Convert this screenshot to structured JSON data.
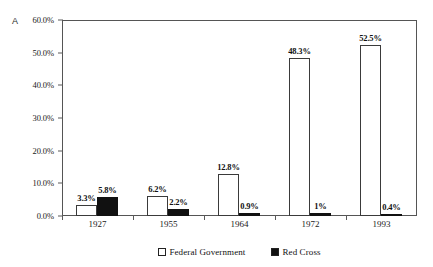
{
  "panel": {
    "label": "A"
  },
  "chart_data": {
    "type": "bar",
    "title": "",
    "xlabel": "",
    "ylabel": "",
    "ylim": [
      0,
      60
    ],
    "ytick_values": [
      0,
      10,
      20,
      30,
      40,
      50,
      60
    ],
    "ytick_labels": [
      "0.0%",
      "10.0%",
      "20.0%",
      "30.0%",
      "40.0%",
      "50.0%",
      "60.0%"
    ],
    "grid": false,
    "legend_position": "bottom-right",
    "categories": [
      "1927",
      "1955",
      "1964",
      "1972",
      "1993"
    ],
    "series": [
      {
        "name": "Federal Government",
        "color": "#ffffff",
        "edge_color": "#3a3a3a",
        "values": [
          3.3,
          6.2,
          12.8,
          48.3,
          52.5
        ],
        "data_labels": [
          "3.3%",
          "6.2%",
          "12.8%",
          "48.3%",
          "52.5%"
        ]
      },
      {
        "name": "Red Cross",
        "color": "#111111",
        "edge_color": "#111111",
        "values": [
          5.8,
          2.2,
          0.9,
          1.0,
          0.4
        ],
        "data_labels": [
          "5.8%",
          "2.2%",
          "0.9%",
          "1%",
          "0.4%"
        ]
      }
    ]
  },
  "legend": {
    "items": [
      {
        "label": "Federal Government",
        "swatch": "white-square"
      },
      {
        "label": "Red Cross",
        "swatch": "black-square"
      }
    ]
  }
}
